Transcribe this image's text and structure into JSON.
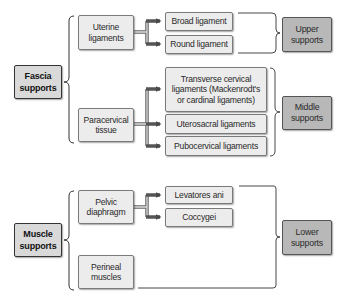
{
  "diagram": {
    "groups": [
      {
        "label": "Fascia supports",
        "children": [
          {
            "label": "Uterine ligaments",
            "items": [
              "Broad ligament",
              "Round ligament"
            ],
            "level": "Upper supports"
          },
          {
            "label": "Paracervical tissue",
            "items": [
              "Transverse cervical ligaments (Mackenrodt's or cardinal ligaments)",
              "Uterosacral ligaments",
              "Pubocervical ligaments"
            ],
            "level": "Middle supports"
          }
        ]
      },
      {
        "label": "Muscle supports",
        "children": [
          {
            "label": "Pelvic diaphragm",
            "items": [
              "Levatores ani",
              "Coccygei"
            ]
          },
          {
            "label": "Perineal muscles",
            "items": []
          }
        ],
        "level": "Lower supports"
      }
    ]
  },
  "nodes": {
    "fascia": "Fascia supports",
    "uterine": "Uterine ligaments",
    "paracervical": "Paracervical tissue",
    "broad": "Broad ligament",
    "round": "Round ligament",
    "transverse": "Transverse cervical ligaments (Mackenrodt's or cardinal ligaments)",
    "uterosacral": "Uterosacral ligaments",
    "pubocervical": "Pubocervical ligaments",
    "upper": "Upper supports",
    "middle": "Middle supports",
    "muscle": "Muscle supports",
    "pelvic": "Pelvic diaphragm",
    "perineal": "Perineal muscles",
    "levatores": "Levatores ani",
    "coccygei": "Coccygei",
    "lower": "Lower supports"
  },
  "colors": {
    "box_fill": "#ececec",
    "root_fill": "#d9d9d9",
    "category_fill": "#b8b8b8",
    "arrow": "#555555",
    "line": "#333333"
  }
}
